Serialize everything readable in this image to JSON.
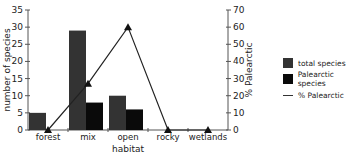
{
  "chart_data": {
    "type": "bar",
    "title": "",
    "xlabel": "habitat",
    "ylabel": "number of species",
    "y2label": "% Palearctic",
    "categories": [
      "forest",
      "mix",
      "open",
      "rocky",
      "wetlands"
    ],
    "series": [
      {
        "name": "total species",
        "type": "bar",
        "axis": "left",
        "color": "#333333",
        "values": [
          5,
          29,
          10,
          0,
          0
        ]
      },
      {
        "name": "Palearctic species",
        "type": "bar",
        "axis": "left",
        "color": "#0a0a0a",
        "values": [
          0,
          8,
          6,
          0,
          0
        ]
      },
      {
        "name": "% Palearctic",
        "type": "line",
        "axis": "right",
        "marker": "triangle",
        "color": "#222222",
        "values": [
          0,
          27,
          60,
          0,
          0
        ]
      }
    ],
    "ylim": [
      0,
      35
    ],
    "y2lim": [
      0,
      70
    ],
    "yticks": [
      0,
      5,
      10,
      15,
      20,
      25,
      30,
      35
    ],
    "y2ticks": [
      0,
      10,
      20,
      30,
      40,
      50,
      60,
      70
    ],
    "grid": false,
    "legend_position": "right"
  },
  "legend": {
    "items": [
      {
        "label": "total species"
      },
      {
        "label": "Palearctic species"
      },
      {
        "label": "% Palearctic"
      }
    ]
  }
}
